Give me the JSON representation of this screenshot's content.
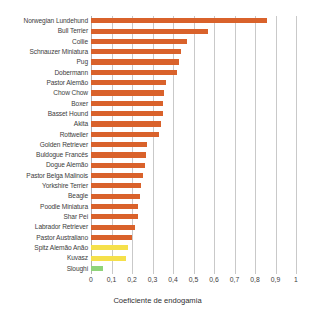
{
  "chart_data": {
    "type": "bar",
    "orientation": "horizontal",
    "title": "",
    "xlabel": "Coeficiente de endogamia",
    "ylabel": "",
    "xlim": [
      0,
      1
    ],
    "xticks": [
      "0",
      "0,1",
      "0,2",
      "0,3",
      "0,4",
      "0,5",
      "0,6",
      "0,7",
      "0,8",
      "0,9",
      "1"
    ],
    "xtick_values": [
      0,
      0.1,
      0.2,
      0.3,
      0.4,
      0.5,
      0.6,
      0.7,
      0.8,
      0.9,
      1
    ],
    "grid": "vertical",
    "legend": "none",
    "categories": [
      "Norwegian Lundehund",
      "Bull Terrier",
      "Collie",
      "Schnauzer Miniatura",
      "Pug",
      "Dobermann",
      "Pastor Alemão",
      "Chow Chow",
      "Boxer",
      "Basset Hound",
      "Akita",
      "Rottweiler",
      "Golden Retriever",
      "Buldogue Francês",
      "Dogue Alemão",
      "Pastor Belga Malinois",
      "Yorkshire Terrier",
      "Beagle",
      "Poodle Miniatura",
      "Shar Pei",
      "Labrador Retriever",
      "Pastor Australiano",
      "Spitz Alemão Anão",
      "Kuvasz",
      "Sloughi"
    ],
    "values": [
      0.86,
      0.57,
      0.47,
      0.44,
      0.43,
      0.42,
      0.365,
      0.355,
      0.35,
      0.35,
      0.34,
      0.33,
      0.275,
      0.27,
      0.265,
      0.255,
      0.245,
      0.24,
      0.23,
      0.23,
      0.215,
      0.2,
      0.18,
      0.17,
      0.06
    ],
    "bar_colors": [
      "#d9622b",
      "#d9622b",
      "#d9622b",
      "#d9622b",
      "#d9622b",
      "#d9622b",
      "#d9622b",
      "#d9622b",
      "#d9622b",
      "#d9622b",
      "#d9622b",
      "#d9622b",
      "#d9622b",
      "#d9622b",
      "#d9622b",
      "#d9622b",
      "#d9622b",
      "#d9622b",
      "#d9622b",
      "#d9622b",
      "#d9622b",
      "#d9622b",
      "#f5e04a",
      "#f5e04a",
      "#8fd47a"
    ],
    "colors": {
      "orange": "#d9622b",
      "yellow": "#f5e04a",
      "green": "#8fd47a",
      "gridline": "#c9c9c9",
      "text": "#3c3c3c",
      "background": "#ffffff"
    }
  }
}
